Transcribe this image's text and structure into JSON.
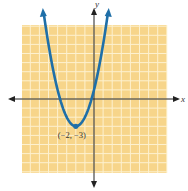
{
  "chart_data": {
    "type": "line",
    "title": "",
    "xlabel": "x",
    "ylabel": "y",
    "xlim": [
      -8,
      8
    ],
    "ylim": [
      -8,
      8
    ],
    "grid": true,
    "equation": "y = (x + 2)^2 - 3",
    "series": [
      {
        "name": "parabola",
        "vertex": [
          -2,
          -3
        ],
        "a": 1,
        "color": "#1f6fa8"
      }
    ],
    "annotations": [
      {
        "text": "(−2, −3)",
        "x": -2,
        "y": -3
      }
    ],
    "colors": {
      "grid_bg": "#f7d58a",
      "grid_line": "#fdf1cf",
      "axis": "#222222",
      "curve": "#1f6fa8"
    }
  }
}
